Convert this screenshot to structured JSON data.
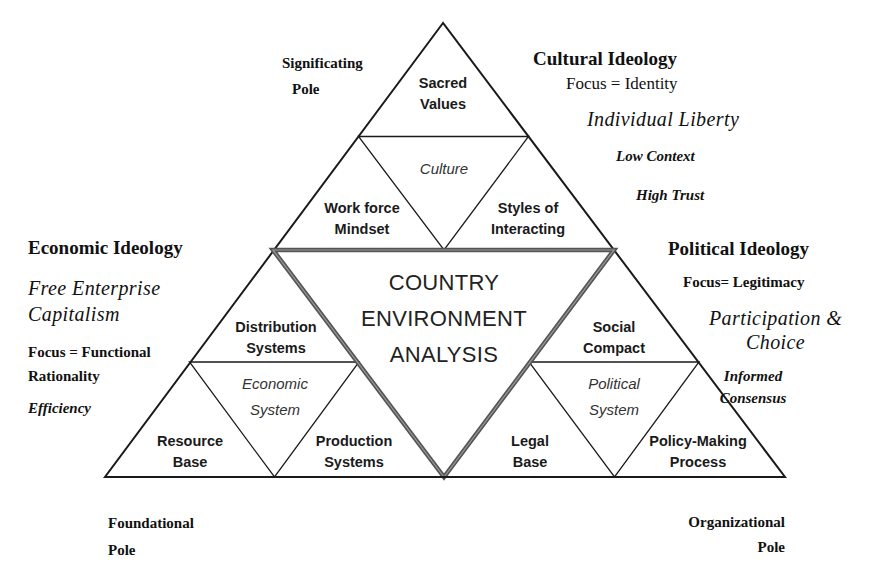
{
  "diagram": {
    "center": {
      "lines": [
        "COUNTRY",
        "ENVIRONMENT",
        "ANALYSIS"
      ]
    },
    "culture": {
      "system_label": "Culture",
      "cells": {
        "top": [
          "Sacred",
          "Values"
        ],
        "left": [
          "Work force",
          "Mindset"
        ],
        "right": [
          "Styles of",
          "Interacting"
        ]
      }
    },
    "economic": {
      "system_label": [
        "Economic",
        "System"
      ],
      "cells": {
        "top": [
          "Distribution",
          "Systems"
        ],
        "left": [
          "Resource",
          "Base"
        ],
        "right": [
          "Production",
          "Systems"
        ]
      }
    },
    "political": {
      "system_label": [
        "Political",
        "System"
      ],
      "cells": {
        "top": [
          "Social",
          "Compact"
        ],
        "left": [
          "Legal",
          "Base"
        ],
        "right": [
          "Policy-Making",
          "Process"
        ]
      }
    },
    "poles": {
      "top": [
        "Significating",
        "Pole"
      ],
      "bottom_left": [
        "Foundational",
        "Pole"
      ],
      "bottom_right": [
        "Organizational",
        "Pole"
      ]
    },
    "cultural_ideology": {
      "heading": "Cultural Ideology",
      "focus": "Focus = Identity",
      "value": "Individual Liberty",
      "traits": [
        "Low Context",
        "High Trust"
      ]
    },
    "economic_ideology": {
      "heading": "Economic Ideology",
      "value": [
        "Free Enterprise",
        "Capitalism"
      ],
      "focus": [
        "Focus = Functional",
        "Rationality"
      ],
      "trait": "Efficiency"
    },
    "political_ideology": {
      "heading": "Political Ideology",
      "focus": "Focus=  Legitimacy",
      "value": [
        "Participation &",
        "Choice"
      ],
      "trait": [
        "Informed",
        "Consensus"
      ]
    },
    "colors": {
      "line": "#1a1a1a",
      "center_border": "#555555",
      "background": "#ffffff"
    }
  }
}
